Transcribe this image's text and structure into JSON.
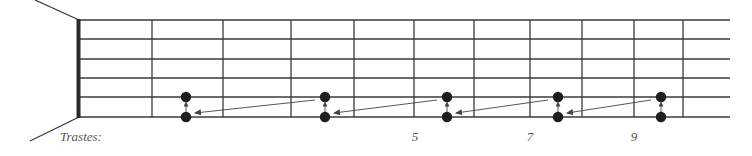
{
  "diagram": {
    "type": "guitar-fretboard",
    "caption_label": "Trastes:",
    "colors": {
      "line": "#3a3a3a",
      "nut": "#2a2a2a",
      "dot": "#1e1e1e",
      "arrow": "#444444",
      "label": "#555555"
    },
    "strings_y": [
      20,
      39,
      59,
      78,
      97,
      117
    ],
    "nut_x": 79,
    "strings_end_x": 730,
    "fret_lines_x": [
      152,
      223,
      291,
      354,
      414,
      474,
      530,
      582,
      634,
      683
    ],
    "fret_numbers": [
      {
        "label": "5",
        "x": 415
      },
      {
        "label": "7",
        "x": 530
      },
      {
        "label": "9",
        "x": 634
      }
    ],
    "note_pairs": [
      {
        "x": 186,
        "upper_string_y": 97,
        "lower_string_y": 117
      },
      {
        "x": 325,
        "upper_string_y": 97,
        "lower_string_y": 117
      },
      {
        "x": 447,
        "upper_string_y": 97,
        "lower_string_y": 117
      },
      {
        "x": 558,
        "upper_string_y": 97,
        "lower_string_y": 117
      },
      {
        "x": 661,
        "upper_string_y": 97,
        "lower_string_y": 117
      }
    ],
    "shift_arrows": [
      {
        "from": [
          315,
          100
        ],
        "to": [
          195,
          113
        ]
      },
      {
        "from": [
          437,
          100
        ],
        "to": [
          334,
          113
        ]
      },
      {
        "from": [
          548,
          100
        ],
        "to": [
          456,
          113
        ]
      },
      {
        "from": [
          651,
          100
        ],
        "to": [
          567,
          113
        ]
      }
    ]
  }
}
